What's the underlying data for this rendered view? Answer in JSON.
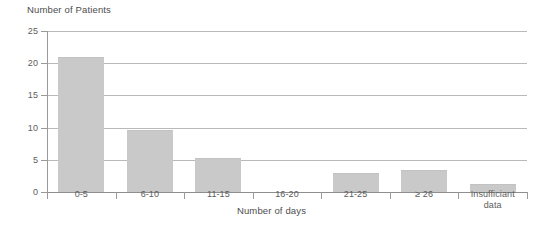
{
  "chart_data": {
    "type": "bar",
    "title": "",
    "ylabel": "Number of Patients",
    "xlabel": "Number of days",
    "categories": [
      "0-5",
      "6-10",
      "11-15",
      "16-20",
      "21-25",
      "≥ 26",
      "Insufficiant data"
    ],
    "values": [
      21.0,
      9.7,
      5.3,
      0,
      2.9,
      3.4,
      1.3
    ],
    "ylim": [
      0,
      25
    ],
    "yticks": [
      0,
      5,
      10,
      15,
      20,
      25
    ],
    "ytick_labels": [
      "0",
      "5",
      "10",
      "15",
      "20",
      "25"
    ],
    "grid": true,
    "legend": false,
    "bar_color": "#c9c9c9",
    "axis_color": "#8e8e8e",
    "gridline_color": "#b9b9b9",
    "text_color": "#5d5d5d"
  },
  "axis": {
    "y_title": "Number of Patients",
    "x_title": "Number of days"
  },
  "x_labels": [
    {
      "line1": "0-5",
      "line2": ""
    },
    {
      "line1": "6-10",
      "line2": ""
    },
    {
      "line1": "11-15",
      "line2": ""
    },
    {
      "line1": "16-20",
      "line2": ""
    },
    {
      "line1": "21-25",
      "line2": ""
    },
    {
      "line1": "≥ 26",
      "line2": ""
    },
    {
      "line1": "Insufficiant",
      "line2": "data"
    }
  ],
  "y_labels": [
    "25",
    "20",
    "15",
    "10",
    "5",
    "0"
  ]
}
